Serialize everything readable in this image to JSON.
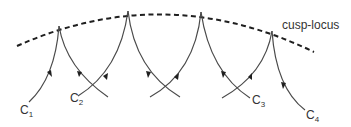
{
  "diagram": {
    "locus_label": "cusp-locus",
    "curve_labels": [
      {
        "letter": "C",
        "sub": "1"
      },
      {
        "letter": "C",
        "sub": "2"
      },
      {
        "letter": "C",
        "sub": "3"
      },
      {
        "letter": "C",
        "sub": "4"
      }
    ],
    "colors": {
      "curve": "#4a4a4a",
      "locus": "#1f1f1f",
      "text": "#333333"
    }
  }
}
